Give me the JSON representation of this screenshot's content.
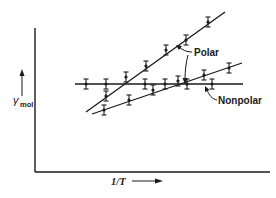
{
  "chart_data": {
    "type": "scatter",
    "title": "",
    "xlabel": "1/T",
    "ylabel": "γ_mol",
    "ylabel_main": "γ",
    "ylabel_sub": "mol",
    "grid": false,
    "legend": "inline annotations with arrows",
    "annotations": [
      "Polar",
      "Nonpolar"
    ],
    "series": [
      {
        "name": "Polar (steep)",
        "group": "Polar",
        "fit": "linear, strongly increasing",
        "points_px": [
          [
            106,
            96
          ],
          [
            126,
            77
          ],
          [
            146,
            66
          ],
          [
            166,
            50
          ],
          [
            186,
            40
          ],
          [
            208,
            22
          ]
        ],
        "line_px": [
          [
            86,
            112
          ],
          [
            225,
            12
          ]
        ]
      },
      {
        "name": "Polar (shallow)",
        "group": "Polar",
        "fit": "linear, moderately increasing",
        "points_px": [
          [
            104,
            110
          ],
          [
            129,
            100
          ],
          [
            153,
            90
          ],
          [
            178,
            81
          ],
          [
            204,
            75
          ],
          [
            229,
            68
          ]
        ],
        "line_px": [
          [
            92,
            114
          ],
          [
            242,
            63
          ]
        ]
      },
      {
        "name": "Nonpolar",
        "group": "Nonpolar",
        "fit": "horizontal (constant)",
        "points_px": [
          [
            86,
            84
          ],
          [
            106,
            84
          ],
          [
            145,
            84
          ],
          [
            165,
            84
          ],
          [
            187,
            84
          ],
          [
            212,
            84
          ]
        ],
        "line_px": [
          [
            75,
            84
          ],
          [
            243,
            84
          ]
        ]
      }
    ],
    "axes": {
      "x_from_px": [
        35,
        172
      ],
      "x_to_px": [
        270,
        172
      ],
      "y_from_px": [
        35,
        172
      ],
      "y_to_px": [
        35,
        28
      ]
    },
    "colors": {
      "ink": "#1a1a1a",
      "background": "#ffffff"
    }
  },
  "labels": {
    "polar": "Polar",
    "nonpolar": "Nonpolar",
    "xaxis": "1/T",
    "yaxis_main": "γ",
    "yaxis_sub": "mol"
  }
}
